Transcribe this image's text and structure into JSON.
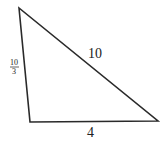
{
  "diagram": {
    "shape": "triangle",
    "vertices": {
      "top_left": [
        19,
        8
      ],
      "bottom_left": [
        30,
        122
      ],
      "bottom_right": [
        158,
        121
      ]
    },
    "stroke_color": "#2a2a2a",
    "sides": {
      "hypotenuse": {
        "label": "10"
      },
      "left": {
        "numerator": "10",
        "denominator": "3"
      },
      "bottom": {
        "label": "4"
      }
    }
  }
}
